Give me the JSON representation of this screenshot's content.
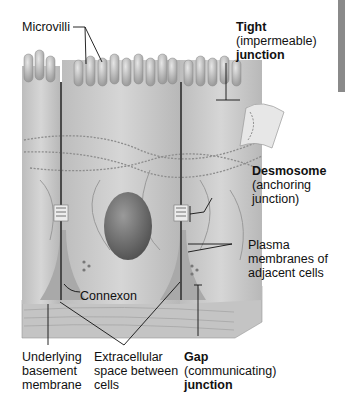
{
  "diagram": {
    "labels": {
      "microvilli": "Microvilli",
      "tight": {
        "bold": "Tight",
        "sub": "(impermeable)",
        "bold2": "junction"
      },
      "desmosome": {
        "bold": "Desmosome",
        "sub": "(anchoring",
        "sub2": "junction)"
      },
      "plasma": {
        "l1": "Plasma",
        "l2": "membranes of",
        "l3": "adjacent cells"
      },
      "connexon": "Connexon",
      "basement": {
        "l1": "Underlying",
        "l2": "basement",
        "l3": "membrane"
      },
      "extracellular": {
        "l1": "Extracellular",
        "l2": "space between",
        "l3": "cells"
      },
      "gap": {
        "bold": "Gap",
        "sub": "(communicating)",
        "bold2": "junction"
      }
    },
    "colors": {
      "cell_fill": "#c9c9c9",
      "cell_shade": "#a8a8a8",
      "membrane_dark": "#4a4a4a",
      "nucleus": "#6e6e6e",
      "basement": "#bdbdbd",
      "leader_line": "#111111"
    }
  }
}
